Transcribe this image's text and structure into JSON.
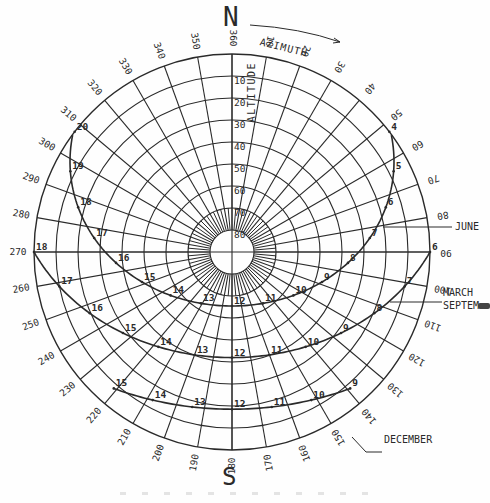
{
  "diagram": {
    "north_label": "N",
    "south_label": "S",
    "azimuth_label": "AZIMUTH",
    "altitude_label": "ALTITUDE",
    "latitude_deg_estimate": 48,
    "center": [
      232,
      252
    ],
    "outer_radius": 198,
    "colors": {
      "ink": "#2a2a2a",
      "background": "#fefefe"
    }
  },
  "chart_data": {
    "type": "polar-sunpath",
    "azimuth_ticks": [
      360,
      10,
      20,
      30,
      40,
      50,
      60,
      70,
      80,
      90,
      100,
      110,
      120,
      130,
      140,
      150,
      160,
      170,
      180,
      190,
      200,
      210,
      220,
      230,
      240,
      250,
      260,
      270,
      280,
      290,
      300,
      310,
      320,
      330,
      340,
      350
    ],
    "altitude_rings": [
      10,
      20,
      30,
      40,
      50,
      60,
      70,
      80
    ],
    "altitude_ring_labels": [
      "10",
      "20",
      "30",
      "40",
      "50",
      "60",
      "70",
      "80"
    ],
    "series": [
      {
        "name": "JUNE",
        "declination": 23.45,
        "hours": [
          4,
          5,
          6,
          7,
          8,
          9,
          10,
          11,
          12,
          13,
          14,
          15,
          16,
          17,
          18,
          19,
          20
        ],
        "hour_labels": [
          "4",
          "5",
          "6",
          "7",
          "8",
          "9",
          "10",
          "11",
          "12",
          "13",
          "14",
          "15",
          "16",
          "17",
          "18",
          "19",
          "20"
        ]
      },
      {
        "name": "MARCH / SEPTEMBER",
        "declination": 0,
        "hours": [
          6,
          7,
          8,
          9,
          10,
          11,
          12,
          13,
          14,
          15,
          16,
          17,
          18
        ],
        "hour_labels": [
          "6",
          "7",
          "8",
          "9",
          "10",
          "11",
          "12",
          "13",
          "14",
          "15",
          "16",
          "17",
          "18"
        ]
      },
      {
        "name": "DECEMBER",
        "declination": -23.45,
        "hours": [
          9,
          10,
          11,
          12,
          13,
          14,
          15
        ],
        "hour_labels": [
          "9",
          "10",
          "11",
          "12",
          "13",
          "14",
          "15"
        ]
      }
    ],
    "callouts": {
      "june": "JUNE",
      "march": "MARCH",
      "september": "SEPTEM",
      "december": "DECEMBER"
    }
  }
}
